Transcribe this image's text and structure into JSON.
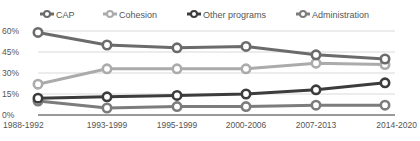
{
  "chart_data": {
    "type": "line",
    "title": "",
    "xlabel": "",
    "ylabel": "",
    "categories": [
      "1988-1992",
      "1993-1999",
      "1995-1999",
      "2000-2006",
      "2007-2013",
      "2014-2020"
    ],
    "yticks": [
      "0%",
      "15%",
      "30%",
      "45%",
      "60%"
    ],
    "ylim": [
      0,
      60
    ],
    "grid": true,
    "legend_position": "top",
    "series": [
      {
        "name": "CAP",
        "color": "#6b6b6b",
        "values": [
          59,
          50,
          48,
          49,
          43,
          40
        ]
      },
      {
        "name": "Cohesion",
        "color": "#ababab",
        "values": [
          22,
          33,
          33,
          33,
          37,
          36
        ]
      },
      {
        "name": "Other programs",
        "color": "#3c3c3c",
        "values": [
          12,
          13,
          14,
          15,
          18,
          23
        ]
      },
      {
        "name": "Administration",
        "color": "#7c7c7c",
        "values": [
          10,
          5,
          6,
          6,
          7,
          7
        ]
      }
    ]
  }
}
